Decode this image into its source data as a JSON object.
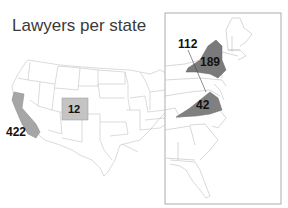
{
  "title": "Lawyers per state",
  "legend_colors": {
    "highlight_dark": "#7a7a7a",
    "highlight_light": "#b9b9b9",
    "state_border": "#b8b8b8",
    "inset_frame": "#9a9a9a"
  },
  "regions": [
    {
      "state": "California",
      "value": "422",
      "shade": "#a6a6a6"
    },
    {
      "state": "Colorado",
      "value": "12",
      "shade": "#c4c4c4"
    },
    {
      "state": "Pennsylvania / New York line pointer",
      "value": "112",
      "shade": "#6e6e6e"
    },
    {
      "state": "New York",
      "value": "189",
      "shade": "#7a7a7a"
    },
    {
      "state": "Virginia",
      "value": "42",
      "shade": "#808080"
    }
  ],
  "labels": {
    "ca": "422",
    "co": "12",
    "ny_callout": "112",
    "ny": "189",
    "va": "42"
  },
  "inset": {
    "description": "Zoomed East Coast"
  }
}
